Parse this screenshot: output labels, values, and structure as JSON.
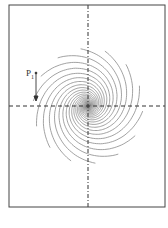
{
  "diagram": {
    "type": "spiral vortex flow field",
    "frame": {
      "x": 9,
      "y": 5,
      "width": 156,
      "height": 202,
      "stroke": "#444444"
    },
    "center": {
      "x": 88,
      "y": 106
    },
    "axis_color": "#333333",
    "curve_color": "#8a8a8a",
    "spiral_count": 14,
    "label": {
      "text": "P",
      "subscript": "1",
      "x": 26,
      "y": 68
    },
    "arrow": {
      "x": 36,
      "y1": 72,
      "y2": 100,
      "direction": "down"
    }
  }
}
